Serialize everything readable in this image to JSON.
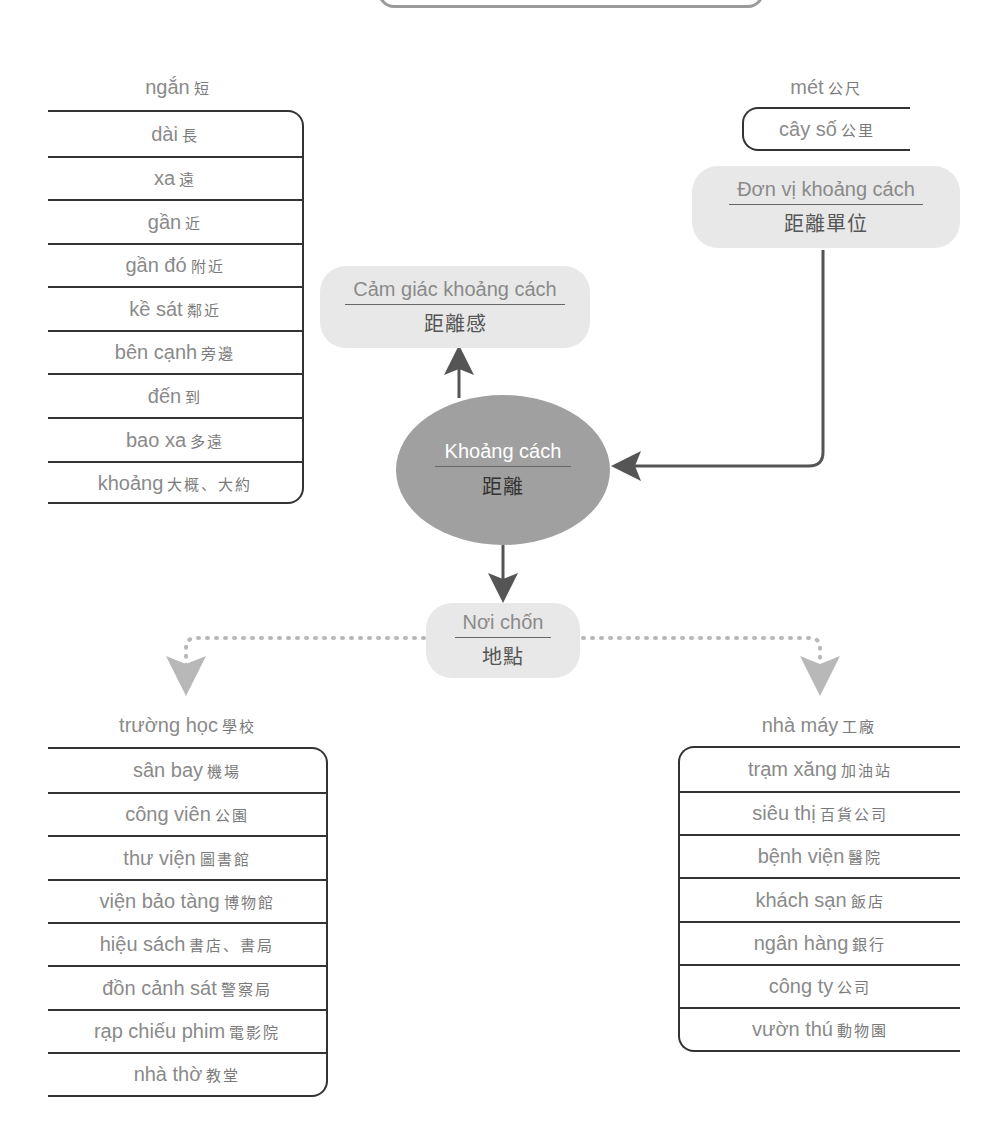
{
  "title_box": {
    "visible": "bottom edge only"
  },
  "center_node": {
    "vi": "Khoảng cách",
    "zh": "距離"
  },
  "nodes": {
    "feeling": {
      "vi": "Cảm giác khoảng cách",
      "zh": "距離感"
    },
    "unit": {
      "vi": "Đơn vị khoảng cách",
      "zh": "距離單位"
    },
    "place": {
      "vi": "Nơi chốn",
      "zh": "地點"
    }
  },
  "distance_words": {
    "header": {
      "vi": "ngắn",
      "zh": "短"
    },
    "rows": [
      {
        "vi": "dài",
        "zh": "長"
      },
      {
        "vi": "xa",
        "zh": "遠"
      },
      {
        "vi": "gần",
        "zh": "近"
      },
      {
        "vi": "gần đó",
        "zh": "附近"
      },
      {
        "vi": "kề sát",
        "zh": "鄰近"
      },
      {
        "vi": "bên cạnh",
        "zh": "旁邊"
      },
      {
        "vi": "đến",
        "zh": "到"
      },
      {
        "vi": "bao xa",
        "zh": "多遠"
      },
      {
        "vi": "khoảng",
        "zh": "大概、大約"
      }
    ]
  },
  "unit_words": {
    "header": {
      "vi": "mét",
      "zh": "公尺"
    },
    "rows": [
      {
        "vi": "cây số",
        "zh": "公里"
      }
    ]
  },
  "places_left": {
    "header": {
      "vi": "trường học",
      "zh": "學校"
    },
    "rows": [
      {
        "vi": "sân bay",
        "zh": "機場"
      },
      {
        "vi": "công viên",
        "zh": "公園"
      },
      {
        "vi": "thư viện",
        "zh": "圖書館"
      },
      {
        "vi": "viện bảo tàng",
        "zh": "博物館"
      },
      {
        "vi": "hiệu sách",
        "zh": "書店、書局"
      },
      {
        "vi": "đồn cảnh sát",
        "zh": "警察局"
      },
      {
        "vi": "rạp chiếu phim",
        "zh": "電影院"
      },
      {
        "vi": "nhà thờ",
        "zh": "教堂"
      }
    ]
  },
  "places_right": {
    "header": {
      "vi": "nhà máy",
      "zh": "工廠"
    },
    "rows": [
      {
        "vi": "trạm xăng",
        "zh": "加油站"
      },
      {
        "vi": "siêu thị",
        "zh": "百貨公司"
      },
      {
        "vi": "bệnh viện",
        "zh": "醫院"
      },
      {
        "vi": "khách sạn",
        "zh": "飯店"
      },
      {
        "vi": "ngân hàng",
        "zh": "銀行"
      },
      {
        "vi": "công ty",
        "zh": "公司"
      },
      {
        "vi": "vườn thú",
        "zh": "動物園"
      }
    ]
  },
  "colors": {
    "center_fill": "#a0a0a0",
    "pill_fill": "#e8e8e8",
    "arrow": "#555555",
    "dotted_arrow": "#b8b8b8",
    "text_gray": "#8a8a8a",
    "line": "#333333"
  }
}
